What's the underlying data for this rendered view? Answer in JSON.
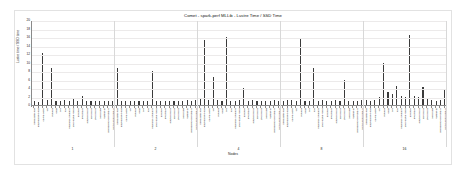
{
  "figure": {
    "title": "Comet - spark-perf MLLib - Lustre Time / SSD Time",
    "xaxis_title": "Nodes",
    "yaxis_title": "Lustre time / SSD time"
  },
  "chart_data": {
    "type": "bar",
    "title": "Comet - spark-perf MLLib - Lustre Time / SSD Time",
    "xlabel": "Nodes",
    "ylabel": "Lustre time / SSD time",
    "ylim": [
      0,
      20
    ],
    "yticks": [
      0,
      2,
      4,
      6,
      8,
      10,
      12,
      14,
      16,
      18,
      20
    ],
    "grid": true,
    "legend": "none",
    "bar_color": "#3b3b3b",
    "group_label_name": "Nodes",
    "groups": [
      {
        "nodes": "1",
        "categories": [
          "glm-regression",
          "glm-classification",
          "naive-bayes",
          "als",
          "kmeans",
          "gmm",
          "svd",
          "pca",
          "summary-statistics",
          "block-matrix-mult",
          "pearson",
          "spearman",
          "chi-sq-feature",
          "chi-sq-gof",
          "chi-sq-mat",
          "word2vec",
          "fp-growth",
          "python-glm-regression",
          "python-naive-bayes"
        ],
        "values": [
          1.0,
          0.6,
          12.2,
          1.2,
          8.8,
          1.0,
          1.0,
          1.1,
          1.0,
          1.3,
          1.0,
          2.1,
          1.0,
          1.0,
          1.0,
          1.0,
          1.0,
          1.0,
          0.9
        ]
      },
      {
        "nodes": "2",
        "categories": [
          "glm-regression",
          "glm-classification",
          "naive-bayes",
          "als",
          "kmeans",
          "gmm",
          "svd",
          "pca",
          "summary-statistics",
          "block-matrix-mult",
          "pearson",
          "spearman",
          "chi-sq-feature",
          "chi-sq-gof",
          "chi-sq-mat",
          "word2vec",
          "fp-growth",
          "python-glm-regression",
          "python-naive-bayes"
        ],
        "values": [
          8.8,
          1.0,
          1.0,
          1.0,
          1.0,
          0.9,
          1.0,
          1.0,
          7.9,
          1.0,
          1.0,
          1.0,
          1.0,
          1.0,
          0.9,
          1.0,
          1.1,
          1.0,
          1.2
        ]
      },
      {
        "nodes": "4",
        "categories": [
          "glm-regression",
          "glm-classification",
          "naive-bayes",
          "als",
          "kmeans",
          "gmm",
          "svd",
          "pca",
          "summary-statistics",
          "block-matrix-mult",
          "pearson",
          "spearman",
          "chi-sq-feature",
          "chi-sq-gof",
          "chi-sq-mat",
          "word2vec",
          "fp-growth",
          "python-glm-regression",
          "python-naive-bayes"
        ],
        "values": [
          1.3,
          15.3,
          1.2,
          6.5,
          1.1,
          1.0,
          16.0,
          1.0,
          1.0,
          1.1,
          3.9,
          1.0,
          1.2,
          1.0,
          1.0,
          1.0,
          1.0,
          1.1,
          1.0
        ]
      },
      {
        "nodes": "8",
        "categories": [
          "glm-regression",
          "glm-classification",
          "naive-bayes",
          "als",
          "kmeans",
          "gmm",
          "svd",
          "pca",
          "summary-statistics",
          "block-matrix-mult",
          "pearson",
          "spearman",
          "chi-sq-feature",
          "chi-sq-gof",
          "chi-sq-mat",
          "word2vec",
          "fp-growth",
          "python-glm-regression",
          "python-naive-bayes"
        ],
        "values": [
          1.0,
          1.1,
          1.2,
          1.0,
          15.8,
          1.0,
          1.0,
          8.7,
          1.0,
          1.1,
          1.0,
          1.0,
          1.2,
          1.0,
          6.0,
          1.0,
          1.0,
          1.0,
          1.1
        ]
      },
      {
        "nodes": "16",
        "categories": [
          "glm-regression",
          "glm-classification",
          "naive-bayes",
          "als",
          "kmeans",
          "gmm",
          "svd",
          "pca",
          "summary-statistics",
          "block-matrix-mult",
          "pearson",
          "spearman",
          "chi-sq-feature",
          "chi-sq-gof",
          "chi-sq-mat",
          "word2vec",
          "fp-growth",
          "python-glm-regression",
          "python-naive-bayes"
        ],
        "values": [
          1.1,
          1.0,
          1.2,
          2.0,
          10.0,
          3.1,
          2.6,
          4.4,
          2.2,
          2.0,
          16.5,
          2.2,
          2.0,
          4.2,
          1.5,
          1.2,
          1.0,
          1.1,
          3.6
        ]
      }
    ]
  }
}
